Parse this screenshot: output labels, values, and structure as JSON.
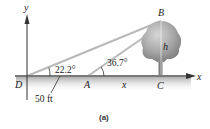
{
  "figure": {
    "caption": "(a)",
    "axes": {
      "x_label": "x",
      "y_label": "y"
    },
    "points": {
      "D": "D",
      "A": "A",
      "B": "B",
      "C": "C"
    },
    "angles": {
      "at_D": "22.2°",
      "at_A": "36.7°"
    },
    "dimensions": {
      "DA": "50 ft",
      "AC": "x",
      "height": "h"
    },
    "colors": {
      "ground": "#8a8a8a",
      "ground_shadow": "#c8c8c8",
      "sight_lines": "#b9b9b9",
      "tree_canopy": "#a0a0a0",
      "tree_trunk": "#7d7d7d",
      "axis": "#333333"
    }
  }
}
